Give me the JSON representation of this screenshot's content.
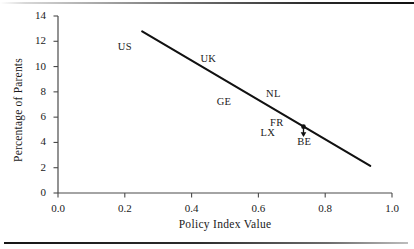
{
  "chart_data": {
    "type": "scatter",
    "title": "",
    "subtitle": "",
    "xlabel": "Policy Index Value",
    "ylabel": "Percentage of Parents",
    "xlim": [
      0.0,
      1.0
    ],
    "ylim": [
      0,
      14
    ],
    "xticks": [
      "0.0",
      "0.2",
      "0.4",
      "0.6",
      "0.8",
      "1.0"
    ],
    "xtick_values": [
      0.0,
      0.2,
      0.4,
      0.6,
      0.8,
      1.0
    ],
    "yticks": [
      "0",
      "2",
      "4",
      "6",
      "8",
      "10",
      "12",
      "14"
    ],
    "ytick_values": [
      0,
      2,
      4,
      6,
      8,
      10,
      12,
      14
    ],
    "grid": false,
    "legend": null,
    "series": [
      {
        "name": "Country labels",
        "type": "text-annotations",
        "points": [
          {
            "label": "US",
            "x": 0.2,
            "y": 11.6
          },
          {
            "label": "UK",
            "x": 0.45,
            "y": 10.7
          },
          {
            "label": "GE",
            "x": 0.497,
            "y": 7.3
          },
          {
            "label": "NL",
            "x": 0.645,
            "y": 7.9
          },
          {
            "label": "FR",
            "x": 0.655,
            "y": 5.6
          },
          {
            "label": "LX",
            "x": 0.628,
            "y": 4.85
          },
          {
            "label": "BE",
            "x": 0.737,
            "y": 4.15
          }
        ]
      },
      {
        "name": "Belgium marker",
        "type": "point",
        "points": [
          {
            "label": "BE",
            "x": 0.735,
            "y": 5.25
          }
        ]
      },
      {
        "name": "Fitted trend line",
        "type": "line",
        "points": [
          {
            "x": 0.252,
            "y": 12.78
          },
          {
            "x": 0.935,
            "y": 2.15
          }
        ]
      }
    ],
    "annotations": [
      {
        "type": "arrow",
        "from": {
          "x": 0.735,
          "y": 5.15
        },
        "to": {
          "x": 0.735,
          "y": 4.55
        },
        "target_label": "BE"
      }
    ],
    "colors": {
      "line": "#111111",
      "axis": "#4a4a4a",
      "text": "#1a1a1a",
      "background": "#ffffff"
    }
  },
  "figure": {
    "rule_top": "page-rule-top",
    "rule_bottom": "page-rule-bottom"
  }
}
